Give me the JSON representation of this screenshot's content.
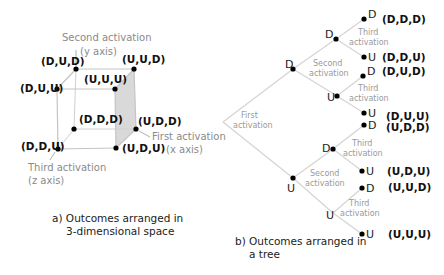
{
  "colors": {
    "edge": "#c8c8c8",
    "hidden_edge": "#d0d0d0",
    "face_fill": "#d9d9d9",
    "dot": "#000000",
    "axis_text": "#8a8a8a",
    "label_text": "#111111"
  },
  "panel_a": {
    "caption_line1": "a)  Outcomes arranged in",
    "caption_line2": "3-dimensional space",
    "axes": {
      "y_line1": "Second activation",
      "y_line2": "(y axis)",
      "x_line1": "First activation",
      "x_line2": "(x axis)",
      "z_line1": "Third activation",
      "z_line2": "(z axis)"
    },
    "vertices": {
      "DUD": "(D,U,D)",
      "UUD": "(U,U,D)",
      "DUU": "(D,U,U)",
      "UUU": "(U,U,U)",
      "DDD": "(D,D,D)",
      "UDD": "(U,D,D)",
      "DDU": "(D,D,U)",
      "UDU": "(U,D,U)"
    }
  },
  "panel_b": {
    "caption_line1": "b)  Outcomes arranged in",
    "caption_line2": "a tree",
    "first_line1": "First",
    "first_line2": "activation",
    "second_line1": "Second",
    "second_line2": "activation",
    "third_line1": "Third",
    "third_line2": "activation",
    "level1": {
      "D": "D",
      "U": "U"
    },
    "level2": {
      "DD": "D",
      "DU": "U",
      "UD": "D",
      "UU": "U"
    },
    "leaves": [
      {
        "node": "D",
        "outcome": "(D,D,D)"
      },
      {
        "node": "U",
        "outcome": "(D,D,U)"
      },
      {
        "node": "D",
        "outcome": "(D,U,D)"
      },
      {
        "node": "U",
        "outcome": "(D,U,U)"
      },
      {
        "node": "D",
        "outcome": "(U,D,D)"
      },
      {
        "node": "U",
        "outcome": "(U,D,U)"
      },
      {
        "node": "D",
        "outcome": "(U,U,D)"
      },
      {
        "node": "U",
        "outcome": "(U,U,U)"
      }
    ]
  }
}
